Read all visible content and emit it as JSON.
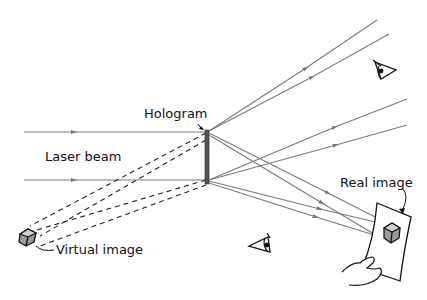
{
  "diagram": {
    "labels": {
      "hologram": "Hologram",
      "laser_beam": "Laser beam",
      "virtual_image": "Virtual image",
      "real_image": "Real image"
    },
    "colors": {
      "ray": "#7a7a7a",
      "dashed": "#222222",
      "plate": "#555555",
      "ink": "#111111",
      "cube_face": "#9a9a9a",
      "cube_top": "#cfcfcf"
    },
    "icons": {
      "eye_upper": "eye-icon",
      "eye_lower": "eye-icon",
      "virtual_cube": "cube-icon",
      "real_cube": "cube-icon",
      "hand": "hand-icon",
      "screen": "paper-screen"
    }
  }
}
